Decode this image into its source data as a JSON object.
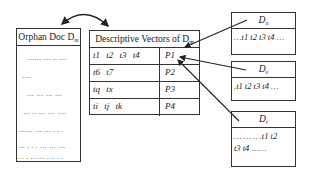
{
  "orphan_doc": {
    "title": "Orphan Doc D",
    "title_sub": "m",
    "lines": [
      "…… … .. …",
      "….",
      "… … … …",
      "… .. … … ….",
      "…… … … . . .",
      "… . . . … … …",
      ". . . …… . .. . ."
    ]
  },
  "descriptive_vectors": {
    "title": "Descriptive Vectors of D",
    "title_sub": "m",
    "rows": [
      {
        "terms": "t1  t2  t3  t4",
        "p": "P1"
      },
      {
        "terms": "t6  t7",
        "p": "P2"
      },
      {
        "terms": "tq  tx",
        "p": "P3"
      },
      {
        "terms": "ti  tj  tk",
        "p": "P4"
      }
    ]
  },
  "documents": [
    {
      "label": "D",
      "label_sub": "u",
      "content": [
        "…t1 t2 t3 t4 …"
      ]
    },
    {
      "label": "D",
      "label_sub": "v",
      "content": [
        ".t1 t2 t3 t4 …"
      ]
    },
    {
      "label": "D",
      "label_sub": "r",
      "content": [
        "… … ..   .t1 t2",
        "t3 t4 ……"
      ]
    }
  ],
  "colors": {
    "line": "#333333",
    "background": "#ffffff"
  }
}
